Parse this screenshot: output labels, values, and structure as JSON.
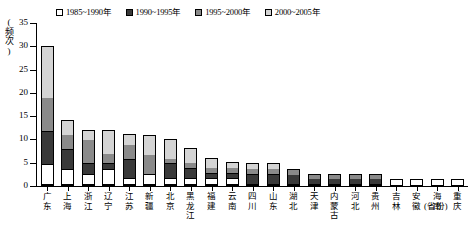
{
  "chart_data": {
    "type": "bar",
    "stacked": true,
    "title": "",
    "xlabel": "(省份)",
    "ylabel": "(频次)",
    "ylim": [
      0,
      35
    ],
    "yticks": [
      0,
      5,
      10,
      15,
      20,
      25,
      30,
      35
    ],
    "grid": false,
    "legend_position": "top",
    "categories": [
      "广东",
      "上海",
      "浙江",
      "辽宁",
      "江苏",
      "新疆",
      "北京",
      "黑龙江",
      "福建",
      "云南",
      "四川",
      "山东",
      "湖北",
      "天津",
      "内蒙古",
      "河北",
      "贵州",
      "吉林",
      "安徽",
      "海南",
      "重庆"
    ],
    "series": [
      {
        "name": "1985~1990年",
        "color": "#ffffff",
        "values": [
          4,
          3,
          2,
          3,
          1,
          2,
          1,
          1,
          1,
          1,
          0,
          0,
          0,
          0,
          0,
          0,
          0,
          1,
          1,
          1,
          1
        ]
      },
      {
        "name": "1990~1995年",
        "color": "#393939",
        "values": [
          7,
          4,
          2,
          1,
          4,
          0,
          3,
          2,
          1,
          1,
          2,
          2,
          2,
          1,
          1,
          1,
          1,
          0,
          0,
          0,
          0
        ]
      },
      {
        "name": "1995~2000年",
        "color": "#8a8a8a",
        "values": [
          7,
          3,
          5,
          2,
          3,
          4,
          1,
          1,
          1,
          1,
          1,
          1,
          1,
          1,
          1,
          1,
          1,
          0,
          0,
          0,
          0
        ]
      },
      {
        "name": "2000~2005年",
        "color": "#d4d4d4",
        "values": [
          11,
          3,
          2,
          5,
          2,
          4,
          4,
          3,
          2,
          1,
          1,
          1,
          0,
          0,
          0,
          0,
          0,
          0,
          0,
          0,
          0
        ]
      }
    ],
    "totals": [
      29,
      13,
      11,
      11,
      10,
      10,
      9,
      7,
      5,
      4,
      4,
      4,
      3,
      2,
      2,
      2,
      2,
      1,
      1,
      1,
      1
    ]
  },
  "legend": {
    "items": [
      {
        "label": "1985~1990年",
        "color": "#ffffff"
      },
      {
        "label": "1990~1995年",
        "color": "#393939"
      },
      {
        "label": "1995~2000年",
        "color": "#8a8a8a"
      },
      {
        "label": "2000~2005年",
        "color": "#d4d4d4"
      }
    ]
  },
  "axes": {
    "y_label_chars": [
      "(",
      "频",
      "次",
      ")"
    ],
    "y_tick_labels": [
      "35",
      "30",
      "25",
      "20",
      "15",
      "10",
      "5",
      "0"
    ],
    "x_unit": "(省份)"
  }
}
